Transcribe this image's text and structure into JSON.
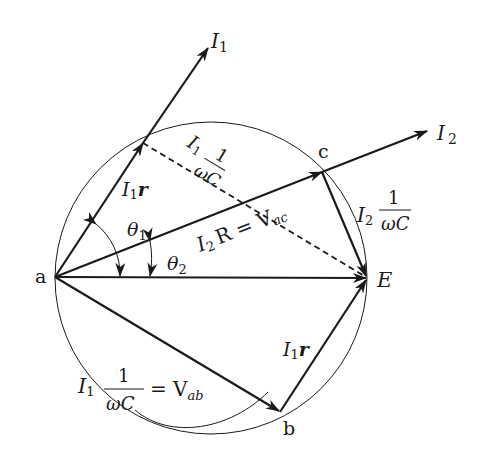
{
  "diagram": {
    "type": "phasor-diagram",
    "points": {
      "a": {
        "label": "a",
        "x": 55,
        "y": 277
      },
      "b": {
        "label": "b",
        "x": 280,
        "y": 412
      },
      "c": {
        "label": "c",
        "x": 322,
        "y": 172
      },
      "E": {
        "label": "E",
        "x": 367,
        "y": 278
      },
      "p": {
        "x": 143,
        "y": 143
      }
    },
    "circle": {
      "cx": 211,
      "cy": 278,
      "r": 156
    },
    "labels": {
      "I1": {
        "main": "I",
        "sub": "1"
      },
      "I2": {
        "main": "I",
        "sub": "2"
      },
      "I1r_upper": {
        "main": "I",
        "sub": "1",
        "tail": "r"
      },
      "I1r_lower": {
        "main": "I",
        "sub": "1",
        "tail": "r"
      },
      "theta1": {
        "main": "θ",
        "sub": "1"
      },
      "theta2": {
        "main": "θ",
        "sub": "2"
      },
      "I2R_Vac": {
        "main": "I",
        "sub": "2",
        "mid": "R = V",
        "sub2": "ac"
      },
      "I1_over_wC_dashed": {
        "main": "I",
        "sub": "1",
        "num": "1",
        "den": "ωC"
      },
      "I2_over_wC": {
        "main": "I",
        "sub": "2",
        "num": "1",
        "den": "ωC"
      },
      "I1_over_wC_Vab": {
        "main": "I",
        "sub": "1",
        "num": "1",
        "den": "ωC",
        "eq": "= V",
        "sub2": "ab"
      }
    },
    "vectors": [
      {
        "from": "a",
        "to": "p",
        "name": "I1r"
      },
      {
        "from": "p",
        "to": "I1-tip",
        "name": "I1"
      },
      {
        "from": "a",
        "to": "c",
        "name": "I2R"
      },
      {
        "from": "c",
        "to": "I2-tip",
        "name": "I2"
      },
      {
        "from": "c",
        "to": "E",
        "name": "I2/wC"
      },
      {
        "from": "a",
        "to": "E",
        "name": "E"
      },
      {
        "from": "a",
        "to": "b",
        "name": "I1/wC"
      },
      {
        "from": "b",
        "to": "E",
        "name": "I1r"
      },
      {
        "from": "p",
        "to": "E",
        "name": "I1/wC",
        "style": "dashed"
      }
    ],
    "colors": {
      "ink": "#1a1a1a",
      "background": "#ffffff"
    }
  }
}
